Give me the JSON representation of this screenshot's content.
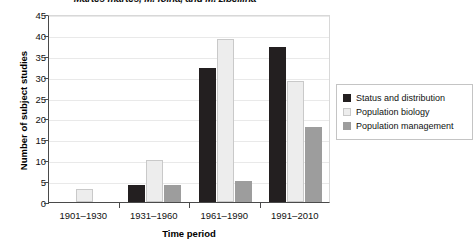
{
  "chart_data": {
    "type": "bar",
    "title": "Martes martes, M. foina, and M. zibellina",
    "xlabel": "Time period",
    "ylabel": "Number of subject studies",
    "categories": [
      "1901–1930",
      "1931–1960",
      "1961–1990",
      "1991–2010"
    ],
    "series": [
      {
        "name": "Status and distribution",
        "color": "#231f20",
        "values": [
          0,
          4,
          32,
          37
        ]
      },
      {
        "name": "Population biology",
        "color": "#ededed",
        "values": [
          3,
          10,
          39,
          29
        ]
      },
      {
        "name": "Population management",
        "color": "#9d9d9d",
        "values": [
          0,
          4,
          5,
          18
        ]
      }
    ],
    "ylim": [
      0,
      45
    ],
    "yticks": [
      0,
      5,
      10,
      15,
      20,
      25,
      30,
      35,
      40,
      45
    ],
    "ytick_labels": [
      "0",
      "5",
      "10",
      "15",
      "20",
      "25",
      "30",
      "35",
      "40",
      "45"
    ],
    "grid": true,
    "legend_position": "right"
  }
}
